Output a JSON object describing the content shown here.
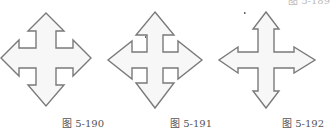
{
  "figures": [
    {
      "id": "arrow-190",
      "caption": "图 5-190",
      "icon": "four-way-move-arrow"
    },
    {
      "id": "arrow-191",
      "caption": "图 5-191",
      "icon": "four-way-move-arrow"
    },
    {
      "id": "arrow-192",
      "caption": "图 5-192",
      "icon": "four-way-move-arrow"
    }
  ],
  "partial_caption_top": "图 5-189",
  "colors": {
    "outline": "#7a7a7a",
    "fill": "#f7f7f7",
    "caption": "#555555"
  }
}
